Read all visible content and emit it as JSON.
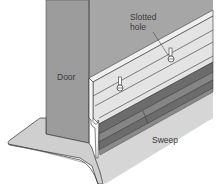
{
  "diagram": {
    "type": "technical-illustration",
    "labels": {
      "door": "Door",
      "slotted_hole_line1": "Slotted",
      "slotted_hole_line2": "hole",
      "sweep": "Sweep"
    },
    "colors": {
      "door": "#9c9c9c",
      "wall": "#a8a8a8",
      "sweep_strip": "#6e6e6e",
      "sweep_strip_light": "#888888",
      "rail": "#e6e6e6",
      "floor": "#d9d9d9",
      "threshold": "#f2f2f2",
      "outline": "#333333",
      "background": "#ffffff"
    }
  }
}
